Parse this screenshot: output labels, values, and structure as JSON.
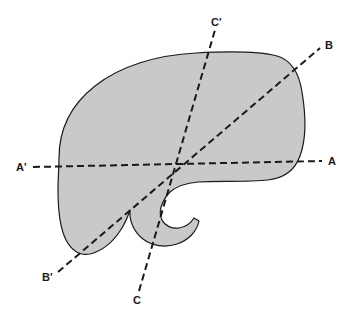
{
  "figure": {
    "background_color": "#ffffff",
    "canvas": {
      "width": 356,
      "height": 319
    }
  },
  "shape": {
    "name": "irregular-blob-with-notch",
    "fill_color": "#c9c9c9",
    "stroke_color": "#1a1a1a",
    "stroke_width": 1.2,
    "description": "Rounded kidney-like outline with a concave hook-shaped notch at the lower middle"
  },
  "cutting_lines": [
    {
      "id": "a",
      "name": "section-line-a",
      "start_label": "A'",
      "end_label": "A",
      "start_point": {
        "x": 33,
        "y": 167
      },
      "end_point": {
        "x": 322,
        "y": 161
      },
      "color": "#1a1a1a",
      "width": 2,
      "dash": "7 4"
    },
    {
      "id": "b",
      "name": "section-line-b",
      "start_label": "B'",
      "end_label": "B",
      "start_point": {
        "x": 58,
        "y": 272
      },
      "end_point": {
        "x": 320,
        "y": 48
      },
      "color": "#1a1a1a",
      "width": 2,
      "dash": "7 4"
    },
    {
      "id": "c",
      "name": "section-line-c",
      "start_label": "C",
      "end_label": "C'",
      "start_point": {
        "x": 139,
        "y": 291
      },
      "end_point": {
        "x": 215,
        "y": 30
      },
      "color": "#1a1a1a",
      "width": 2,
      "dash": "7 4"
    }
  ],
  "labels": {
    "a_prime": "A'",
    "a": "A",
    "b_prime": "B'",
    "b": "B",
    "c_prime": "C'",
    "c": "C"
  },
  "label_positions": {
    "a_prime": {
      "x": 16,
      "y": 171
    },
    "a": {
      "x": 328,
      "y": 165
    },
    "b_prime": {
      "x": 42,
      "y": 281
    },
    "b": {
      "x": 325,
      "y": 49
    },
    "c_prime": {
      "x": 211,
      "y": 26
    },
    "c": {
      "x": 133,
      "y": 304
    }
  }
}
